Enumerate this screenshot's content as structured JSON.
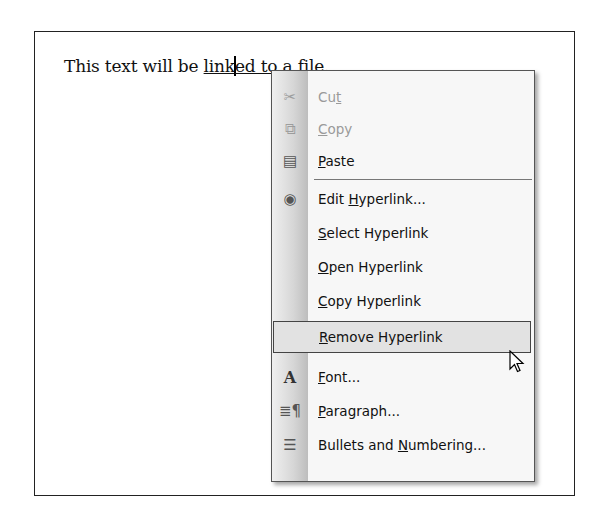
{
  "document": {
    "text_before": "This text will be ",
    "link_part1": "link",
    "link_part2": "ed to a file."
  },
  "context_menu": {
    "items": [
      {
        "pre": "Cu",
        "key": "t",
        "post": "",
        "icon": "scissors-icon",
        "glyph": "✂",
        "disabled": true
      },
      {
        "pre": "",
        "key": "C",
        "post": "opy",
        "icon": "copy-icon",
        "glyph": "⧉",
        "disabled": true
      },
      {
        "pre": "",
        "key": "P",
        "post": "aste",
        "icon": "paste-icon",
        "glyph": "📋",
        "disabled": false
      },
      {
        "pre": "Edit ",
        "key": "H",
        "post": "yperlink...",
        "icon": "hyperlink-globe-icon",
        "glyph": "🌐",
        "disabled": false
      },
      {
        "pre": "",
        "key": "S",
        "post": "elect Hyperlink",
        "icon": "",
        "glyph": "",
        "disabled": false
      },
      {
        "pre": "",
        "key": "O",
        "post": "pen Hyperlink",
        "icon": "",
        "glyph": "",
        "disabled": false
      },
      {
        "pre": "",
        "key": "C",
        "post": "opy Hyperlink",
        "icon": "",
        "glyph": "",
        "disabled": false
      },
      {
        "pre": "",
        "key": "R",
        "post": "emove Hyperlink",
        "icon": "",
        "glyph": "",
        "disabled": false,
        "hover": true
      },
      {
        "pre": "",
        "key": "F",
        "post": "ont...",
        "icon": "font-icon",
        "glyph": "A",
        "disabled": false
      },
      {
        "pre": "",
        "key": "P",
        "post": "aragraph...",
        "icon": "paragraph-icon",
        "glyph": "¶",
        "disabled": false
      },
      {
        "pre": "Bullets and ",
        "key": "N",
        "post": "umbering...",
        "icon": "bullets-icon",
        "glyph": "☰",
        "disabled": false
      }
    ]
  }
}
